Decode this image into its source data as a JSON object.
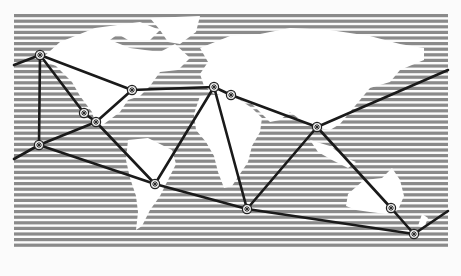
{
  "diagram": {
    "type": "network-over-world-map",
    "colors": {
      "background": "#fbfbfb",
      "ocean_stripe": "#8a8a8a",
      "land": "#ffffff",
      "link": "#1a1a1a",
      "node_fill": "#e8e8e8",
      "node_stroke": "#222222"
    },
    "map": {
      "x": 14,
      "y": 14,
      "width": 434,
      "height": 234,
      "stripe_pitch": 5.6,
      "stripe_thickness": 3.2
    },
    "nodes": [
      {
        "id": "n1",
        "x": 40,
        "y": 55
      },
      {
        "id": "n2",
        "x": 84,
        "y": 113
      },
      {
        "id": "n3",
        "x": 96,
        "y": 122
      },
      {
        "id": "n4",
        "x": 39,
        "y": 145
      },
      {
        "id": "n5",
        "x": 132,
        "y": 90
      },
      {
        "id": "n6",
        "x": 155,
        "y": 184
      },
      {
        "id": "n7",
        "x": 214,
        "y": 87
      },
      {
        "id": "n8",
        "x": 231,
        "y": 95
      },
      {
        "id": "n9",
        "x": 247,
        "y": 209
      },
      {
        "id": "n10",
        "x": 317,
        "y": 127
      },
      {
        "id": "n11",
        "x": 391,
        "y": 208
      },
      {
        "id": "n12",
        "x": 414,
        "y": 234
      }
    ],
    "links": [
      [
        "edgeL1",
        "n1"
      ],
      [
        "n1",
        "n4"
      ],
      [
        "n1",
        "n2"
      ],
      [
        "n1",
        "n5"
      ],
      [
        "n2",
        "n3"
      ],
      [
        "n3",
        "n5"
      ],
      [
        "n3",
        "n4"
      ],
      [
        "n3",
        "n6"
      ],
      [
        "edgeL2",
        "n4"
      ],
      [
        "n4",
        "n6"
      ],
      [
        "n5",
        "n7"
      ],
      [
        "n7",
        "n8"
      ],
      [
        "n7",
        "n6"
      ],
      [
        "n7",
        "n9"
      ],
      [
        "n8",
        "n10"
      ],
      [
        "n10",
        "edgeR1"
      ],
      [
        "n10",
        "n9"
      ],
      [
        "n10",
        "n11"
      ],
      [
        "n6",
        "n9"
      ],
      [
        "n9",
        "n12"
      ],
      [
        "n11",
        "n12"
      ],
      [
        "n12",
        "edgeR2"
      ]
    ],
    "edge_points": {
      "edgeL1": {
        "x": 14,
        "y": 65
      },
      "edgeL2": {
        "x": 14,
        "y": 159
      },
      "edgeR1": {
        "x": 448,
        "y": 70
      },
      "edgeR2": {
        "x": 448,
        "y": 211
      }
    }
  }
}
